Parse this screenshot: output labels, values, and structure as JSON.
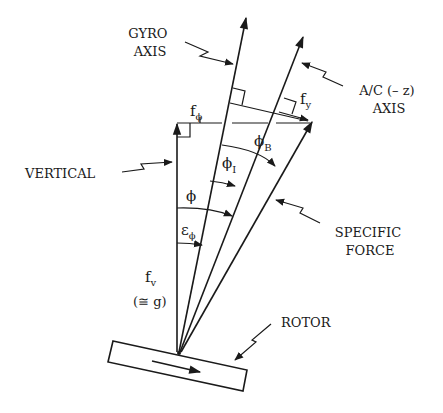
{
  "labels": {
    "gyro_axis": [
      "GYRO",
      "AXIS"
    ],
    "ac_axis": [
      "A/C (– z)",
      "AXIS"
    ],
    "vertical": "VERTICAL",
    "specific_force": [
      "SPECIFIC",
      "FORCE"
    ],
    "rotor": "ROTOR",
    "f_phi": {
      "base": "f",
      "sub": "ϕ"
    },
    "f_y": {
      "base": "f",
      "sub": "y"
    },
    "phi_B": {
      "base": "ϕ",
      "sub": "B"
    },
    "phi_I": {
      "base": "ϕ",
      "sub": "I"
    },
    "phi": "ϕ",
    "eps_phi": {
      "base": "ε",
      "sub": "ϕ"
    },
    "f_v": {
      "base": "f",
      "sub": "v"
    },
    "approx_g": "(≅ g)"
  },
  "colors": {
    "ink": "#1a1a1a",
    "background": "#ffffff"
  }
}
